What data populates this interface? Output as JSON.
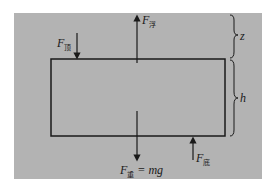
{
  "diagram": {
    "background_color": "#b3b3b3",
    "block": {
      "label": "submerged block"
    },
    "forces": {
      "buoyancy": {
        "symbol": "F",
        "subscript": "浮",
        "direction": "up"
      },
      "top_pressure": {
        "symbol": "F",
        "subscript": "顶",
        "direction": "down"
      },
      "bottom_pressure": {
        "symbol": "F",
        "subscript": "底",
        "direction": "up"
      },
      "weight": {
        "symbol": "F",
        "subscript": "重",
        "equation": " = mg",
        "direction": "down"
      }
    },
    "dimensions": {
      "depth": {
        "label": "z"
      },
      "height": {
        "label": "h"
      }
    }
  }
}
